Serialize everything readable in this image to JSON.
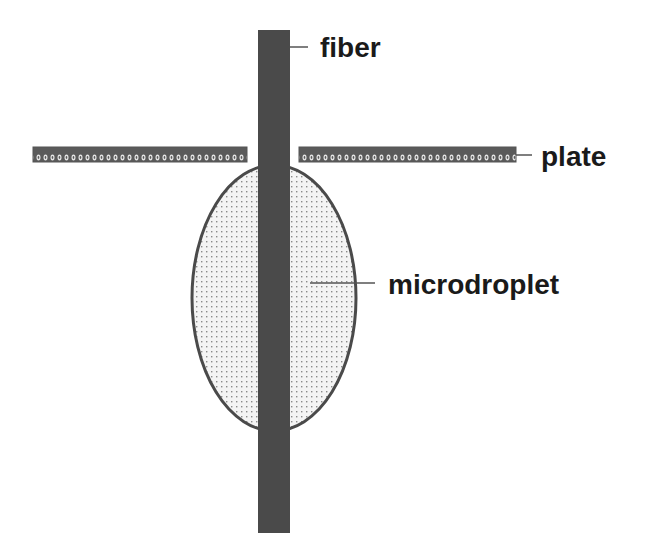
{
  "diagram": {
    "labels": {
      "fiber": "fiber",
      "plate": "plate",
      "microdroplet": "microdroplet"
    },
    "colors": {
      "fiber": "#4a4a4a",
      "plate_fill": "#5a5a5a",
      "plate_dots": "#e8e8e8",
      "droplet_fill": "#f2f2f2",
      "droplet_dots": "#8a8a8a",
      "droplet_outline": "#4a4a4a",
      "leader_line": "#555555",
      "text": "#1a1a1a"
    }
  }
}
